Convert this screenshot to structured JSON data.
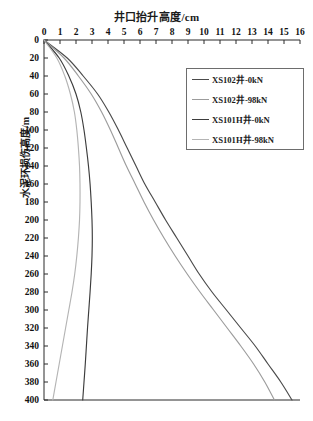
{
  "chart_data": {
    "type": "line",
    "title": "井口抬升高度/cm",
    "xlabel": "井口抬升高度/cm",
    "ylabel": "水泥环损伤高度/m",
    "xlim": [
      0,
      16
    ],
    "ylim": [
      0,
      400
    ],
    "y_axis_inverted": true,
    "x_axis_position": "top",
    "grid": false,
    "legend_position": "upper-right",
    "xticks": [
      0,
      1,
      2,
      3,
      4,
      5,
      6,
      7,
      8,
      9,
      10,
      11,
      12,
      13,
      14,
      15,
      16
    ],
    "yticks": [
      0,
      20,
      40,
      60,
      80,
      100,
      120,
      140,
      160,
      180,
      200,
      220,
      240,
      260,
      280,
      300,
      320,
      340,
      360,
      380,
      400
    ],
    "series": [
      {
        "name": "XS102井-0kN",
        "color": "#4a4a4a",
        "y": [
          0,
          20,
          40,
          60,
          80,
          100,
          120,
          140,
          160,
          180,
          200,
          220,
          240,
          260,
          280,
          300,
          320,
          340,
          360,
          380,
          400
        ],
        "x": [
          0.0,
          1.45,
          2.45,
          3.35,
          4.05,
          4.65,
          5.2,
          5.75,
          6.3,
          6.95,
          7.6,
          8.3,
          9.0,
          9.7,
          10.5,
          11.4,
          12.3,
          13.2,
          14.0,
          14.8,
          15.5
        ]
      },
      {
        "name": "XS102井-98kN",
        "color": "#9c9c9c",
        "y": [
          0,
          20,
          40,
          60,
          80,
          100,
          120,
          140,
          160,
          180,
          200,
          220,
          240,
          260,
          280,
          300,
          320,
          340,
          360,
          380,
          400
        ],
        "x": [
          0.0,
          1.25,
          2.15,
          2.95,
          3.6,
          4.15,
          4.65,
          5.15,
          5.7,
          6.25,
          6.85,
          7.5,
          8.2,
          8.95,
          9.75,
          10.6,
          11.45,
          12.3,
          13.1,
          13.8,
          14.4
        ]
      },
      {
        "name": "XS101H井-0kN",
        "color": "#3c3c3c",
        "y": [
          0,
          20,
          40,
          60,
          80,
          100,
          120,
          140,
          160,
          180,
          200,
          220,
          240,
          260,
          280,
          300,
          320,
          340,
          360,
          380,
          400
        ],
        "x": [
          0.0,
          0.95,
          1.55,
          2.0,
          2.3,
          2.5,
          2.65,
          2.78,
          2.88,
          2.95,
          3.0,
          3.02,
          3.0,
          2.95,
          2.88,
          2.8,
          2.72,
          2.65,
          2.58,
          2.5,
          2.42
        ]
      },
      {
        "name": "XS101H井-98kN",
        "color": "#b4b4b4",
        "y": [
          0,
          20,
          40,
          60,
          80,
          100,
          120,
          140,
          160,
          180,
          200,
          220,
          240,
          260,
          280,
          300,
          320,
          340,
          360,
          380,
          400
        ],
        "x": [
          0.0,
          0.8,
          1.3,
          1.65,
          1.9,
          2.05,
          2.15,
          2.22,
          2.25,
          2.25,
          2.22,
          2.15,
          2.05,
          1.92,
          1.75,
          1.55,
          1.35,
          1.15,
          0.95,
          0.75,
          0.55
        ]
      }
    ]
  },
  "legend": {
    "items": [
      {
        "label": "XS102井-0kN"
      },
      {
        "label": "XS102井-98kN"
      },
      {
        "label": "XS101H井-0kN"
      },
      {
        "label": "XS101H井-98kN"
      }
    ]
  }
}
